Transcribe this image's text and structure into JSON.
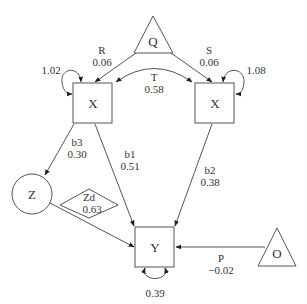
{
  "nodes": {
    "q": {
      "label": "Q",
      "shape": "triangle"
    },
    "x_left": {
      "label": "X",
      "shape": "square"
    },
    "x_right": {
      "label": "X",
      "shape": "square"
    },
    "z": {
      "label": "Z",
      "shape": "circle"
    },
    "zd": {
      "label": "Zd",
      "value": "0.63",
      "shape": "diamond"
    },
    "y": {
      "label": "Y",
      "shape": "square"
    },
    "o": {
      "label": "O",
      "shape": "triangle"
    }
  },
  "edges": {
    "r": {
      "label": "R",
      "value": "0.06"
    },
    "s": {
      "label": "S",
      "value": "0.06"
    },
    "t": {
      "label": "T",
      "value": "0.58"
    },
    "b1": {
      "label": "b1",
      "value": "0.51"
    },
    "b2": {
      "label": "b2",
      "value": "0.38"
    },
    "b3": {
      "label": "b3",
      "value": "0.30"
    },
    "p": {
      "label": "P",
      "value": "−0.02"
    }
  },
  "self_loops": {
    "x_left": "1.02",
    "x_right": "1.08",
    "y": "0.39"
  }
}
